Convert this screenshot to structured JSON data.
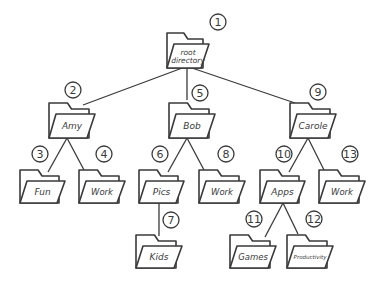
{
  "diagram": {
    "type": "directory-tree",
    "stroke_color": "#3a3a3a",
    "background": "#ffffff",
    "nodes": [
      {
        "id": 1,
        "label": "root directory",
        "lines": [
          "root",
          "directory"
        ],
        "x": 167,
        "y": 28,
        "w": 40,
        "h": 40,
        "badge": "1",
        "bx": 218,
        "by": 22,
        "fs": 7.5
      },
      {
        "id": 2,
        "label": "Amy",
        "lines": [
          "Amy"
        ],
        "x": 49,
        "y": 98,
        "w": 44,
        "h": 40,
        "badge": "2",
        "bx": 73,
        "by": 90,
        "fs": 9
      },
      {
        "id": 5,
        "label": "Bob",
        "lines": [
          "Bob"
        ],
        "x": 169,
        "y": 98,
        "w": 44,
        "h": 40,
        "badge": "5",
        "bx": 200,
        "by": 93,
        "fs": 9
      },
      {
        "id": 9,
        "label": "Carole",
        "lines": [
          "Carole"
        ],
        "x": 290,
        "y": 98,
        "w": 44,
        "h": 40,
        "badge": "9",
        "bx": 318,
        "by": 92,
        "fs": 9
      },
      {
        "id": 3,
        "label": "Fun",
        "lines": [
          "Fun"
        ],
        "x": 20,
        "y": 165,
        "w": 43,
        "h": 38,
        "badge": "3",
        "bx": 40,
        "by": 154,
        "fs": 9
      },
      {
        "id": 4,
        "label": "Work",
        "lines": [
          "Work"
        ],
        "x": 79,
        "y": 165,
        "w": 44,
        "h": 38,
        "badge": "4",
        "bx": 104,
        "by": 154,
        "fs": 8.5
      },
      {
        "id": 6,
        "label": "Pics",
        "lines": [
          "Pics"
        ],
        "x": 139,
        "y": 165,
        "w": 43,
        "h": 38,
        "badge": "6",
        "bx": 160,
        "by": 154,
        "fs": 9
      },
      {
        "id": 8,
        "label": "Work",
        "lines": [
          "Work"
        ],
        "x": 199,
        "y": 165,
        "w": 44,
        "h": 38,
        "badge": "8",
        "bx": 226,
        "by": 154,
        "fs": 8.5
      },
      {
        "id": 10,
        "label": "Apps",
        "lines": [
          "Apps"
        ],
        "x": 260,
        "y": 165,
        "w": 43,
        "h": 38,
        "badge": "10",
        "bx": 284,
        "by": 154,
        "fs": 9
      },
      {
        "id": 13,
        "label": "Work",
        "lines": [
          "Work"
        ],
        "x": 319,
        "y": 165,
        "w": 44,
        "h": 38,
        "badge": "13",
        "bx": 350,
        "by": 154,
        "fs": 8.5
      },
      {
        "id": 7,
        "label": "Kids",
        "lines": [
          "Kids"
        ],
        "x": 136,
        "y": 230,
        "w": 44,
        "h": 38,
        "badge": "7",
        "bx": 171,
        "by": 220,
        "fs": 9
      },
      {
        "id": 11,
        "label": "Games",
        "lines": [
          "Games"
        ],
        "x": 230,
        "y": 230,
        "w": 44,
        "h": 38,
        "badge": "11",
        "bx": 254,
        "by": 219,
        "fs": 8.5
      },
      {
        "id": 12,
        "label": "Productivity",
        "lines": [
          "Productivity"
        ],
        "x": 287,
        "y": 230,
        "w": 44,
        "h": 38,
        "badge": "12",
        "bx": 314,
        "by": 219,
        "fs": 5.5
      }
    ],
    "edges": [
      {
        "from": 1,
        "to": 2,
        "x1": 185,
        "y1": 67,
        "x2": 83,
        "y2": 105
      },
      {
        "from": 1,
        "to": 5,
        "x1": 187,
        "y1": 67,
        "x2": 187,
        "y2": 100
      },
      {
        "from": 1,
        "to": 9,
        "x1": 189,
        "y1": 67,
        "x2": 295,
        "y2": 103
      },
      {
        "from": 2,
        "to": 3,
        "x1": 67,
        "y1": 138,
        "x2": 48,
        "y2": 172
      },
      {
        "from": 2,
        "to": 4,
        "x1": 67,
        "y1": 138,
        "x2": 84,
        "y2": 170
      },
      {
        "from": 5,
        "to": 6,
        "x1": 187,
        "y1": 138,
        "x2": 168,
        "y2": 172
      },
      {
        "from": 5,
        "to": 8,
        "x1": 187,
        "y1": 138,
        "x2": 204,
        "y2": 170
      },
      {
        "from": 9,
        "to": 10,
        "x1": 308,
        "y1": 138,
        "x2": 289,
        "y2": 172
      },
      {
        "from": 9,
        "to": 13,
        "x1": 308,
        "y1": 138,
        "x2": 324,
        "y2": 170
      },
      {
        "from": 6,
        "to": 7,
        "x1": 159,
        "y1": 203,
        "x2": 159,
        "y2": 236
      },
      {
        "from": 10,
        "to": 11,
        "x1": 283,
        "y1": 203,
        "x2": 265,
        "y2": 237
      },
      {
        "from": 10,
        "to": 12,
        "x1": 283,
        "y1": 203,
        "x2": 298,
        "y2": 234
      }
    ]
  }
}
